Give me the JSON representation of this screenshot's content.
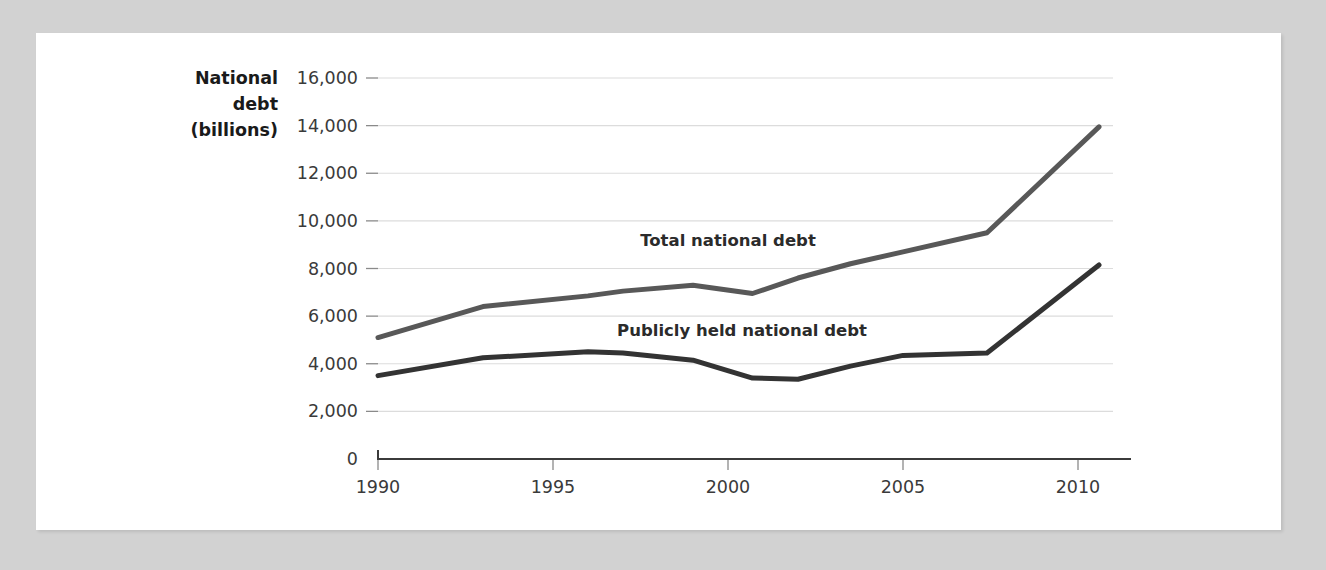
{
  "figure": {
    "background_color": "#d2d2d2",
    "card_color": "#ffffff"
  },
  "chart_data": {
    "type": "line",
    "title": "",
    "ylabel_lines": [
      "National",
      "debt",
      "(billions)"
    ],
    "xlabel": "",
    "grid": true,
    "legend_position": "inline-annotation",
    "xlim": [
      1990,
      2011
    ],
    "ylim": [
      0,
      16000
    ],
    "yticks": [
      0,
      2000,
      4000,
      6000,
      8000,
      10000,
      12000,
      14000,
      16000
    ],
    "ytick_labels": [
      "0",
      "2,000",
      "4,000",
      "6,000",
      "8,000",
      "10,000",
      "12,000",
      "14,000",
      "16,000"
    ],
    "xticks": [
      1990,
      1995,
      2000,
      2005,
      2010
    ],
    "xtick_labels": [
      "1990",
      "1995",
      "2000",
      "2005",
      "2010"
    ],
    "series": [
      {
        "name": "Total national debt",
        "color": "#585858",
        "stroke_width": 5,
        "label_x": 2000.0,
        "label_y": 8950,
        "x": [
          1990,
          1993,
          1996,
          1997,
          1999,
          2000.7,
          2002,
          2003.5,
          2005,
          2007.4,
          2010.6
        ],
        "values": [
          5100,
          6400,
          6850,
          7050,
          7300,
          6950,
          7600,
          8200,
          8700,
          9500,
          13950
        ]
      },
      {
        "name": "Publicly held national debt",
        "color": "#333333",
        "stroke_width": 5,
        "label_x": 2000.4,
        "label_y": 5150,
        "x": [
          1990,
          1993,
          1996,
          1997,
          1999,
          2000.7,
          2002,
          2003.5,
          2005,
          2007.4,
          2010.6
        ],
        "values": [
          3500,
          4250,
          4500,
          4450,
          4150,
          3400,
          3350,
          3900,
          4350,
          4450,
          8150
        ]
      }
    ]
  }
}
